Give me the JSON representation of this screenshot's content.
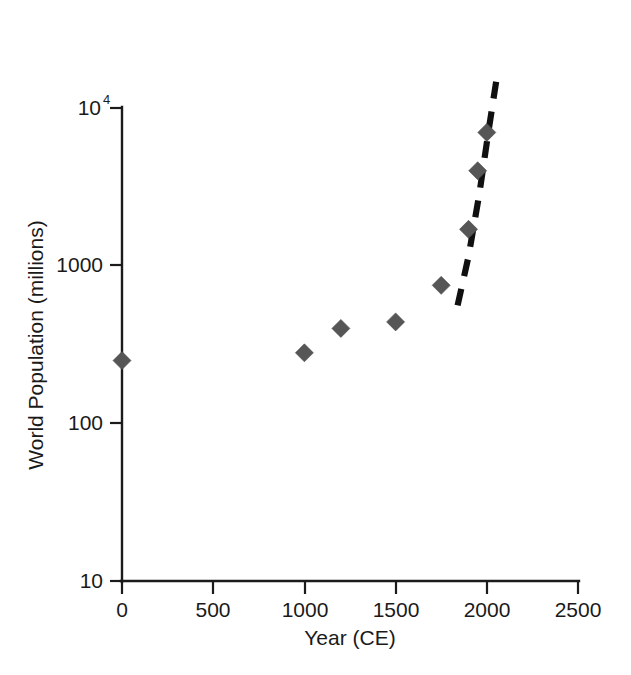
{
  "chart_data": {
    "type": "scatter",
    "title": "",
    "xlabel": "Year (CE)",
    "ylabel": "World Population (millions)",
    "yscale": "log",
    "xscale": "linear",
    "xlim": [
      0,
      2500
    ],
    "ylim": [
      10,
      10000
    ],
    "grid": false,
    "legend": null,
    "xticks": [
      {
        "value": 0,
        "label": "0"
      },
      {
        "value": 500,
        "label": "500"
      },
      {
        "value": 1000,
        "label": "1000"
      },
      {
        "value": 1500,
        "label": "1500"
      },
      {
        "value": 2000,
        "label": "2000"
      },
      {
        "value": 2500,
        "label": "2500"
      }
    ],
    "yticks": [
      {
        "value": 10000,
        "label": "10",
        "exponent": "4"
      },
      {
        "value": 1000,
        "label": "1000",
        "exponent": ""
      },
      {
        "value": 100,
        "label": "100",
        "exponent": ""
      },
      {
        "value": 10,
        "label": "10",
        "exponent": ""
      }
    ],
    "series": [
      {
        "name": "World population",
        "marker": "diamond",
        "color": "#565656",
        "x": [
          0,
          1000,
          1200,
          1500,
          1750,
          1900,
          1950,
          2000
        ],
        "y": [
          250,
          280,
          400,
          440,
          750,
          1700,
          4000,
          7000
        ]
      }
    ],
    "annotations": [
      {
        "name": "exponential-trend-dashed-line",
        "type": "dashed-curve",
        "style": "dashed",
        "color": "#101010",
        "x": [
          1840,
          1900,
          1960,
          2010,
          2060
        ],
        "y": [
          560,
          1150,
          2900,
          7200,
          17000
        ]
      }
    ]
  }
}
